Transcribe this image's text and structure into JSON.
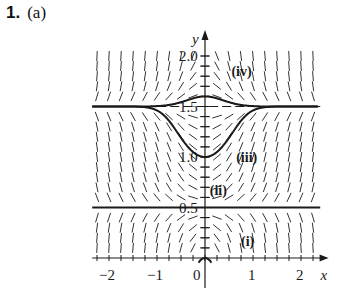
{
  "problem": {
    "number": "1.",
    "part": "(a)"
  },
  "chart_data": {
    "type": "line",
    "xlabel": "x",
    "ylabel": "y",
    "xlim": [
      -2.3,
      2.4
    ],
    "ylim": [
      0,
      2.2
    ],
    "x_ticks": [
      -2,
      -1,
      0,
      1,
      2
    ],
    "x_tick_labels": [
      "−2",
      "−1",
      "0",
      "1",
      "2"
    ],
    "y_ticks": [
      0.5,
      1.0,
      1.5,
      2.0
    ],
    "y_tick_labels": [
      "0.5",
      "1.0",
      "1.5",
      "2.0"
    ],
    "equilibria": [
      {
        "y": 0.5,
        "style": "solid"
      },
      {
        "y": 1.5,
        "style": "dashed"
      }
    ],
    "curves": [
      {
        "name": "(i)",
        "y0": 0.0,
        "label_x": 0.75,
        "label_y": 0.12
      },
      {
        "name": "(ii)",
        "y0": 0.5,
        "label_x": 0.1,
        "label_y": 0.62
      },
      {
        "name": "(iii)",
        "y0": 1.0,
        "label_x": 0.65,
        "label_y": 0.95
      },
      {
        "name": "(iv)",
        "y0": 1.6,
        "label_x": 0.55,
        "label_y": 1.8
      }
    ],
    "colors": {
      "ink": "#1a1a1a",
      "field": "#333333"
    }
  }
}
